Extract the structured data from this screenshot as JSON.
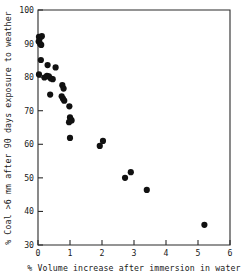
{
  "chart_data": {
    "type": "scatter",
    "title": "",
    "xlabel": "% Volume increase after immersion in water",
    "ylabel": "% Coal >6 mm after 90 days exposure to weather",
    "xlim": [
      0,
      6
    ],
    "ylim": [
      30,
      100
    ],
    "xticks": [
      0,
      1,
      2,
      3,
      4,
      5,
      6
    ],
    "yticks": [
      30,
      40,
      50,
      60,
      70,
      80,
      90,
      100
    ],
    "xtick_labels": [
      "0",
      "1",
      "2",
      "3",
      "4",
      "5",
      "6"
    ],
    "ytick_labels": [
      "30",
      "40",
      "50",
      "60",
      "70",
      "80",
      "90",
      "100"
    ],
    "grid": false,
    "legend": null,
    "marker": "filled-circle",
    "marker_color": "#111111",
    "marker_size": 3.1,
    "points": [
      {
        "x": 0.03,
        "y": 92.0
      },
      {
        "x": 0.05,
        "y": 91.4
      },
      {
        "x": 0.12,
        "y": 92.2
      },
      {
        "x": 0.02,
        "y": 90.6
      },
      {
        "x": 0.07,
        "y": 89.9
      },
      {
        "x": 0.1,
        "y": 89.6
      },
      {
        "x": 0.09,
        "y": 85.1
      },
      {
        "x": 0.3,
        "y": 83.6
      },
      {
        "x": 0.55,
        "y": 82.9
      },
      {
        "x": 0.03,
        "y": 80.8
      },
      {
        "x": 0.28,
        "y": 80.4
      },
      {
        "x": 0.34,
        "y": 80.2
      },
      {
        "x": 0.4,
        "y": 79.6
      },
      {
        "x": 0.46,
        "y": 79.4
      },
      {
        "x": 0.2,
        "y": 79.9
      },
      {
        "x": 0.76,
        "y": 77.6
      },
      {
        "x": 0.8,
        "y": 76.6
      },
      {
        "x": 0.38,
        "y": 74.8
      },
      {
        "x": 0.74,
        "y": 74.3
      },
      {
        "x": 0.78,
        "y": 73.6
      },
      {
        "x": 0.82,
        "y": 73.0
      },
      {
        "x": 0.98,
        "y": 71.3
      },
      {
        "x": 1.0,
        "y": 68.0
      },
      {
        "x": 1.02,
        "y": 67.4
      },
      {
        "x": 1.05,
        "y": 67.1
      },
      {
        "x": 0.97,
        "y": 66.6
      },
      {
        "x": 1.0,
        "y": 61.9
      },
      {
        "x": 1.93,
        "y": 59.5
      },
      {
        "x": 2.03,
        "y": 61.0
      },
      {
        "x": 2.72,
        "y": 50.0
      },
      {
        "x": 2.9,
        "y": 51.7
      },
      {
        "x": 3.4,
        "y": 46.4
      },
      {
        "x": 5.2,
        "y": 36.0
      }
    ]
  },
  "geometry": {
    "plot_left": 38,
    "plot_right": 230,
    "plot_top": 10,
    "plot_bottom": 245
  }
}
